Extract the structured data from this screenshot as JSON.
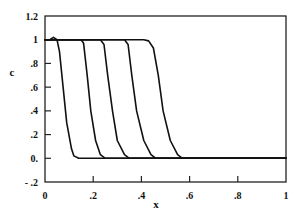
{
  "chart_data": {
    "type": "line",
    "title": "",
    "xlabel": "x",
    "ylabel": "c",
    "xlim": [
      0,
      1
    ],
    "ylim": [
      -0.2,
      1.2
    ],
    "grid": false,
    "legend": null,
    "x_ticks": [
      {
        "value": 0,
        "label": "0"
      },
      {
        "value": 0.2,
        "label": ".2"
      },
      {
        "value": 0.4,
        "label": ".4"
      },
      {
        "value": 0.6,
        "label": ".6"
      },
      {
        "value": 0.8,
        "label": ".8"
      },
      {
        "value": 1.0,
        "label": "1"
      }
    ],
    "y_ticks": [
      {
        "value": 1.2,
        "label": "1.2"
      },
      {
        "value": 1.0,
        "label": "1"
      },
      {
        "value": 0.8,
        "label": ".8"
      },
      {
        "value": 0.6,
        "label": ".6"
      },
      {
        "value": 0.4,
        "label": ".4"
      },
      {
        "value": 0.2,
        "label": ".2"
      },
      {
        "value": 0.0,
        "label": "0."
      },
      {
        "value": -0.2,
        "label": "- .2"
      }
    ],
    "series": [
      {
        "name": "profile-1",
        "x": [
          0,
          0.02,
          0.035,
          0.05,
          0.06,
          0.075,
          0.09,
          0.11,
          0.12,
          0.14,
          1.0
        ],
        "y": [
          1.0,
          1.0,
          1.02,
          1.0,
          0.9,
          0.6,
          0.3,
          0.08,
          0.02,
          0.0,
          0.0
        ]
      },
      {
        "name": "profile-2",
        "x": [
          0,
          0.12,
          0.15,
          0.16,
          0.175,
          0.19,
          0.21,
          0.23,
          0.25,
          1.0
        ],
        "y": [
          1.0,
          1.0,
          1.0,
          0.97,
          0.7,
          0.4,
          0.15,
          0.03,
          0.0,
          0.0
        ]
      },
      {
        "name": "profile-3",
        "x": [
          0,
          0.2,
          0.23,
          0.245,
          0.26,
          0.28,
          0.3,
          0.33,
          0.35,
          1.0
        ],
        "y": [
          1.0,
          1.0,
          1.0,
          0.96,
          0.7,
          0.4,
          0.15,
          0.03,
          0.0,
          0.0
        ]
      },
      {
        "name": "profile-4",
        "x": [
          0,
          0.3,
          0.33,
          0.345,
          0.36,
          0.38,
          0.41,
          0.44,
          0.46,
          1.0
        ],
        "y": [
          1.0,
          1.0,
          1.0,
          0.96,
          0.7,
          0.4,
          0.15,
          0.03,
          0.0,
          0.0
        ]
      },
      {
        "name": "profile-5",
        "x": [
          0,
          0.41,
          0.43,
          0.45,
          0.47,
          0.49,
          0.52,
          0.55,
          0.57,
          1.0
        ],
        "y": [
          1.0,
          1.0,
          0.99,
          0.93,
          0.7,
          0.4,
          0.15,
          0.03,
          0.0,
          0.0
        ]
      }
    ],
    "baseline": {
      "y": 0.0
    }
  },
  "layout": {
    "plot": {
      "left": 45,
      "top": 16,
      "right": 286,
      "bottom": 182
    },
    "line_color": "#111111",
    "frame_color": "#222222"
  }
}
